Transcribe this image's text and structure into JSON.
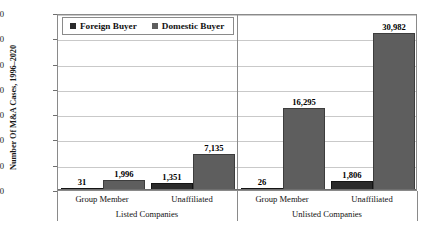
{
  "chart_data": {
    "type": "bar",
    "title": "",
    "xlabel": "",
    "ylabel": "Number Of M&A Cases, 1996–2020",
    "ylim": [
      0,
      35000
    ],
    "ytick_step": 5000,
    "ytick_labels": [
      "0",
      "5,000",
      "10,000",
      "15,000",
      "20,000",
      "25,000",
      "30,000",
      "35,000"
    ],
    "ytick_values": [
      0,
      5000,
      10000,
      15000,
      20000,
      25000,
      30000,
      35000
    ],
    "grid": "horizontal",
    "legend_position": "top-left",
    "categories": [
      "Group Member",
      "Unaffiliated",
      "Group Member",
      "Unaffiliated"
    ],
    "group_labels": [
      "Listed Companies",
      "Unlisted Companies"
    ],
    "series": [
      {
        "name": "Foreign Buyer",
        "color": "#2b2b2b",
        "values": [
          31,
          1351,
          26,
          1806
        ],
        "data_labels": [
          "31",
          "1,351",
          "26",
          "1,806"
        ]
      },
      {
        "name": "Domestic Buyer",
        "color": "#5e5e5e",
        "values": [
          1996,
          7135,
          16295,
          30982
        ],
        "data_labels": [
          "1,996",
          "7,135",
          "16,295",
          "30,982"
        ]
      }
    ]
  },
  "legend": {
    "items": [
      {
        "label": "Foreign Buyer",
        "swatch": "foreign-buyer-swatch"
      },
      {
        "label": "Domestic Buyer",
        "swatch": "domestic-buyer-swatch"
      }
    ]
  },
  "axis": {
    "y_title": "Number Of M&A Cases, 1996–2020",
    "ticks": [
      "35,000",
      "30,000",
      "25,000",
      "20,000",
      "15,000",
      "10,000",
      "5,000",
      "0"
    ]
  },
  "xaxis": {
    "sub_labels": [
      "Group Member",
      "Unaffiliated",
      "Group Member",
      "Unaffiliated"
    ],
    "group_labels": [
      "Listed Companies",
      "Unlisted Companies"
    ]
  },
  "data_labels": {
    "listed_group_foreign": "31",
    "listed_group_domestic": "1,996",
    "listed_unaff_foreign": "1,351",
    "listed_unaff_domestic": "7,135",
    "unlisted_group_foreign": "26",
    "unlisted_group_domestic": "16,295",
    "unlisted_unaff_foreign": "1,806",
    "unlisted_unaff_domestic": "30,982"
  }
}
